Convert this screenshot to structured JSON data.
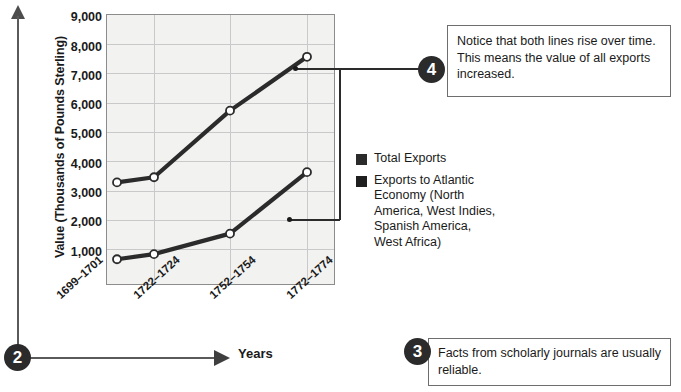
{
  "chart_data": {
    "type": "line",
    "title": "",
    "xlabel": "Years",
    "ylabel": "Value (Thousands of Pounds Sterling)",
    "categories": [
      "1699–1701",
      "1722–1724",
      "1752–1754",
      "1772–1774"
    ],
    "ylim": [
      0,
      9000
    ],
    "yticks": [
      "1,000",
      "2,000",
      "3,000",
      "4,000",
      "5,000",
      "6,000",
      "7,000",
      "8,000",
      "9,000"
    ],
    "ytick_values": [
      1000,
      2000,
      3000,
      4000,
      5000,
      6000,
      7000,
      8000,
      9000
    ],
    "grid": true,
    "legend_position": "right",
    "series": [
      {
        "name": "Total Exports",
        "color": "#2b2b2b",
        "values": [
          3600,
          3800,
          6400,
          8500
        ]
      },
      {
        "name": "Exports to Atlantic Economy (North America, West Indies, Spanish America, West Africa)",
        "color": "#2b2b2b",
        "values": [
          600,
          800,
          1600,
          4000
        ]
      }
    ]
  },
  "legend": {
    "items": [
      {
        "label": "Total Exports",
        "color": "#2b2b2b"
      },
      {
        "label": "Exports to Atlantic Economy (North America, West Indies, Spanish America, West Africa)",
        "color": "#2b2b2b"
      }
    ]
  },
  "callouts": [
    {
      "number": "4",
      "text": "Notice that both lines rise over time. This means the value of all exports increased."
    },
    {
      "number": "3",
      "text": "Facts from scholarly journals are usually reliable."
    }
  ],
  "markers": {
    "axis_y_number": "2",
    "callout_3_number": "3",
    "callout_4_number": "4"
  },
  "axis_titles": {
    "x": "Years",
    "y": "Value (Thousands of Pounds Sterling)"
  }
}
